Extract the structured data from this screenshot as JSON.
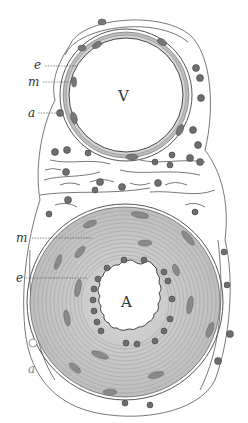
{
  "figure": {
    "vein": {
      "label": "V"
    },
    "artery": {
      "label": "A"
    },
    "vein_layer_labels": {
      "intima": "e",
      "media": "m",
      "adventitia": "a"
    },
    "artery_layer_labels": {
      "media": "m",
      "intima": "e",
      "adventitia": "a"
    },
    "colors": {
      "ink": "#333333",
      "cell": "#6e6e6e",
      "paper": "#ffffff",
      "media_fill": "#c9c9c9"
    }
  }
}
